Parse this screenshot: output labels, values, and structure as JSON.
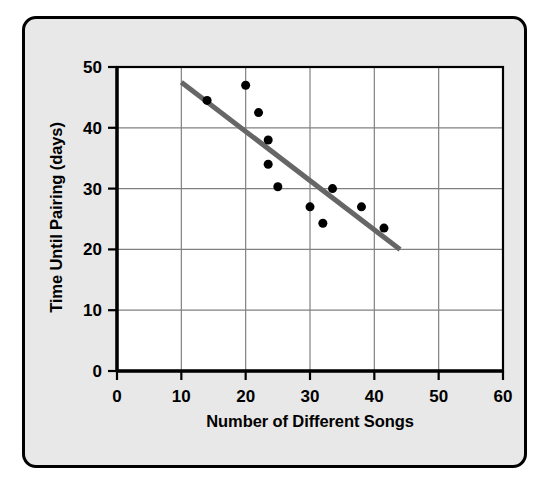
{
  "figure": {
    "background_color": "#e8e8e8",
    "border_color": "#000000",
    "plot_background_color": "#ffffff"
  },
  "chart_data": {
    "type": "scatter",
    "title": "",
    "xlabel": "Number of Different Songs",
    "ylabel": "Time Until Pairing (days)",
    "xlim": [
      0,
      60
    ],
    "ylim": [
      0,
      50
    ],
    "xticks": [
      0,
      10,
      20,
      30,
      40,
      50,
      60
    ],
    "yticks": [
      0,
      10,
      20,
      30,
      40,
      50
    ],
    "xtick_labels": [
      "0",
      "10",
      "20",
      "30",
      "40",
      "50",
      "60"
    ],
    "ytick_labels": [
      "0",
      "10",
      "20",
      "30",
      "40",
      "50"
    ],
    "grid": true,
    "grid_color": "#808080",
    "legend": false,
    "marker_color": "#000000",
    "marker_size": 9,
    "points": [
      {
        "x": 14.0,
        "y": 44.5
      },
      {
        "x": 20.0,
        "y": 47.0
      },
      {
        "x": 22.0,
        "y": 42.5
      },
      {
        "x": 23.5,
        "y": 38.0
      },
      {
        "x": 23.5,
        "y": 34.0
      },
      {
        "x": 25.0,
        "y": 30.3
      },
      {
        "x": 30.0,
        "y": 27.0
      },
      {
        "x": 32.0,
        "y": 24.3
      },
      {
        "x": 33.5,
        "y": 30.0
      },
      {
        "x": 38.0,
        "y": 27.0
      },
      {
        "x": 41.5,
        "y": 23.5
      }
    ],
    "trend_line": {
      "name": "line of best fit",
      "color": "#666666",
      "width": 5,
      "x0": 10.0,
      "y0": 47.5,
      "x1": 44.0,
      "y1": 20.0
    }
  }
}
